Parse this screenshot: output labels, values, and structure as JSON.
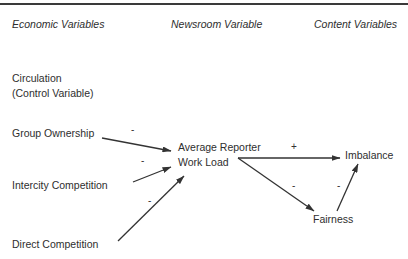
{
  "headers": {
    "economic": "Economic Variables",
    "newsroom": "Newsroom Variable",
    "content": "Content Variables"
  },
  "nodes": {
    "circulation_line1": "Circulation",
    "circulation_line2": "(Control Variable)",
    "group_ownership": "Group Ownership",
    "intercity_competition": "Intercity Competition",
    "direct_competition": "Direct Competition",
    "workload_line1": "Average Reporter",
    "workload_line2": "Work Load",
    "imbalance": "Imbalance",
    "fairness": "Fairness"
  },
  "edges": [
    {
      "from": "Group Ownership",
      "to": "Average Reporter Work Load",
      "sign": "-"
    },
    {
      "from": "Intercity Competition",
      "to": "Average Reporter Work Load",
      "sign": "-"
    },
    {
      "from": "Direct Competition",
      "to": "Average Reporter Work Load",
      "sign": "-"
    },
    {
      "from": "Average Reporter Work Load",
      "to": "Imbalance",
      "sign": "+"
    },
    {
      "from": "Average Reporter Work Load",
      "to": "Fairness",
      "sign": "-"
    },
    {
      "from": "Fairness",
      "to": "Imbalance",
      "sign": "-"
    }
  ]
}
